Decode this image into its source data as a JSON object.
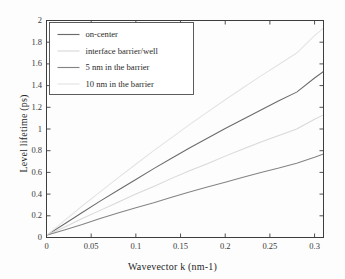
{
  "chart_data": {
    "type": "line",
    "title": "",
    "xlabel": "Wavevector k (nm-1)",
    "ylabel": "Level lifetime (ps)",
    "xlim": [
      0,
      0.31
    ],
    "ylim": [
      0,
      2
    ],
    "xticks": [
      "0",
      "0.05",
      "0.1",
      "0.15",
      "0.2",
      "0.25",
      "0.3"
    ],
    "xtick_values": [
      0,
      0.05,
      0.1,
      0.15,
      0.2,
      0.25,
      0.3
    ],
    "yticks": [
      "0",
      "0.2",
      "0.4",
      "0.6",
      "0.8",
      "1",
      "1.2",
      "1.4",
      "1.6",
      "1.8",
      "2"
    ],
    "ytick_values": [
      0,
      0.2,
      0.4,
      0.6,
      0.8,
      1,
      1.2,
      1.4,
      1.6,
      1.8,
      2
    ],
    "grid": false,
    "legend_position": "upper-left",
    "x": [
      0,
      0.02,
      0.04,
      0.06,
      0.08,
      0.1,
      0.12,
      0.14,
      0.16,
      0.18,
      0.2,
      0.22,
      0.24,
      0.26,
      0.28,
      0.3,
      0.31
    ],
    "series": [
      {
        "name": "on-center",
        "color": "#6b6b6b",
        "values": [
          0.02,
          0.125,
          0.23,
          0.335,
          0.435,
          0.535,
          0.635,
          0.73,
          0.825,
          0.915,
          1.005,
          1.09,
          1.175,
          1.26,
          1.34,
          1.47,
          1.53
        ]
      },
      {
        "name": "interface barrier/well",
        "color": "#d8d8d8",
        "values": [
          0.02,
          0.095,
          0.175,
          0.25,
          0.325,
          0.4,
          0.47,
          0.545,
          0.615,
          0.68,
          0.75,
          0.815,
          0.88,
          0.94,
          1.0,
          1.09,
          1.13
        ]
      },
      {
        "name": "5 nm in the barrier",
        "color": "#848484",
        "values": [
          0.02,
          0.07,
          0.12,
          0.175,
          0.225,
          0.275,
          0.32,
          0.37,
          0.42,
          0.465,
          0.51,
          0.555,
          0.6,
          0.64,
          0.685,
          0.74,
          0.77
        ]
      },
      {
        "name": "10 nm in the barrier",
        "color": "#e3e3e3",
        "values": [
          0.02,
          0.155,
          0.29,
          0.42,
          0.55,
          0.675,
          0.8,
          0.92,
          1.04,
          1.155,
          1.27,
          1.38,
          1.49,
          1.595,
          1.7,
          1.86,
          1.93
        ]
      }
    ]
  },
  "axes": {
    "frame_color": "#3d3d3d",
    "tick_color": "#3d3d3d"
  },
  "legend": {
    "items": [
      {
        "label": "on-center"
      },
      {
        "label": "interface barrier/well"
      },
      {
        "label": "5 nm in the barrier"
      },
      {
        "label": "10 nm in the barrier"
      }
    ]
  }
}
